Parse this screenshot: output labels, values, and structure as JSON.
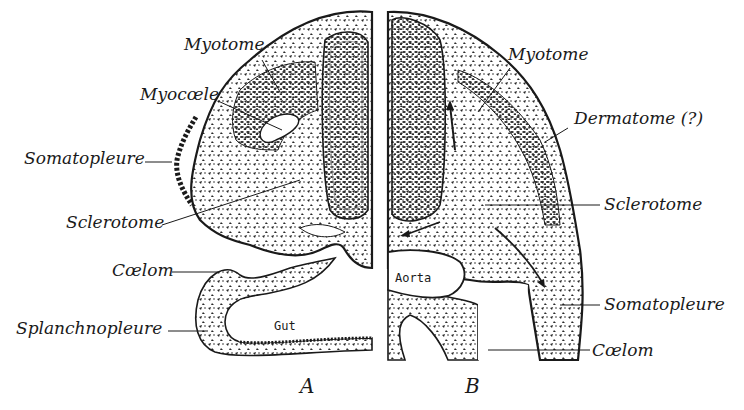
{
  "figure": {
    "panels": [
      {
        "id": "A",
        "label": "A",
        "structures": {
          "myotome": "Myotome",
          "myocoele": "Myocœle",
          "somatopleure": "Somatopleure",
          "sclerotome": "Sclerotome",
          "coelom": "Cœlom",
          "splanchnopleure": "Splanchnopleure",
          "gut": "Gut"
        }
      },
      {
        "id": "B",
        "label": "B",
        "structures": {
          "myotome": "Myotome",
          "dermatome": "Dermatome (?)",
          "sclerotome": "Sclerotome",
          "aorta": "Aorta",
          "somatopleure": "Somatopleure",
          "coelom": "Cœlom"
        }
      }
    ],
    "colors": {
      "ink": "#1a1a1a",
      "background": "#ffffff"
    }
  }
}
